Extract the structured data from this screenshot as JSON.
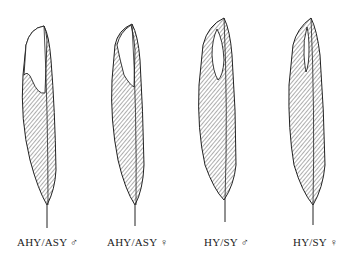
{
  "figure": {
    "feathers": [
      {
        "label": "AHY/ASY ♂",
        "age": "AHY/ASY",
        "sex": "♂"
      },
      {
        "label": "AHY/ASY ♀",
        "age": "AHY/ASY",
        "sex": "♀"
      },
      {
        "label": "HY/SY ♂",
        "age": "HY/SY",
        "sex": "♂"
      },
      {
        "label": "HY/SY ♀",
        "age": "HY/SY",
        "sex": "♀"
      }
    ],
    "colors": {
      "ink": "#222222",
      "background": "#ffffff"
    }
  }
}
